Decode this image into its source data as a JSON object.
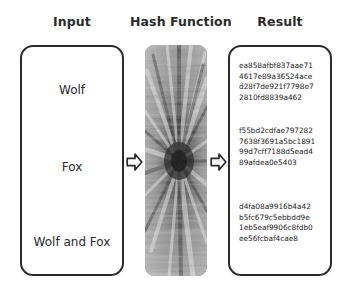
{
  "headers": {
    "input": "Input",
    "hash_function": "Hash Function",
    "result": "Result"
  },
  "inputs": [
    {
      "label": "Wolf"
    },
    {
      "label": "Fox"
    },
    {
      "label": "Wolf and Fox"
    }
  ],
  "arrows": [
    {
      "icon": "arrow-right-outline-icon"
    },
    {
      "icon": "arrow-right-outline-icon"
    }
  ],
  "hash_function": {
    "image_description": "grayscale radial fur texture",
    "colors": {
      "dark": "#2f2f2f",
      "mid": "#8a8a8a",
      "light": "#e2e2e2"
    }
  },
  "results": [
    {
      "lines": [
        "ea858afbf837aae71",
        "4617e89a36524ace",
        "d28f7de921f7798e7",
        "2810fd8839a462"
      ]
    },
    {
      "lines": [
        "f55bd2cdfae797282",
        "7638f3691a5bc1891",
        "99d7cff7188d5ead4",
        "89afdea0e5403"
      ]
    },
    {
      "lines": [
        "d4fa08a9916b4a42",
        "b5fc679c5ebbdd9e",
        "1eb5eaf9906c8fdb0",
        "ee56fcbaf4cae8"
      ]
    }
  ],
  "colors": {
    "border": "#2a2a2a",
    "text": "#2b2b2b",
    "background": "#ffffff"
  }
}
